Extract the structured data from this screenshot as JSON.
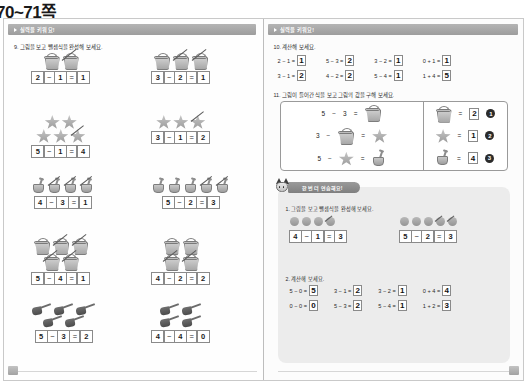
{
  "title": "70~71쪽",
  "left_page": {
    "band_label": "실력을 키워요!",
    "q9": {
      "label": "9. 그림을 보고 뺄셈식을 완성해 보세요.",
      "rows": [
        {
          "left": {
            "icon": "bucket",
            "total": 2,
            "crossed": 1,
            "layout": [
              2
            ],
            "eq": [
              "2",
              "−",
              "1",
              "=",
              "1"
            ]
          },
          "right": {
            "icon": "bucket",
            "total": 3,
            "crossed": 2,
            "layout": [
              3
            ],
            "eq": [
              "3",
              "−",
              "2",
              "=",
              "1"
            ]
          }
        },
        {
          "left": {
            "icon": "star",
            "total": 5,
            "crossed": 1,
            "layout": [
              2,
              3
            ],
            "eq": [
              "5",
              "−",
              "1",
              "=",
              "4"
            ]
          },
          "right": {
            "icon": "star",
            "total": 3,
            "crossed": 1,
            "layout": [
              3
            ],
            "eq": [
              "3",
              "−",
              "1",
              "=",
              "2"
            ]
          }
        },
        {
          "left": {
            "icon": "shovel",
            "total": 4,
            "crossed": 3,
            "layout": [
              4
            ],
            "eq": [
              "4",
              "−",
              "3",
              "=",
              "1"
            ]
          },
          "right": {
            "icon": "shovel",
            "total": 5,
            "crossed": 2,
            "layout": [
              5
            ],
            "eq": [
              "5",
              "−",
              "2",
              "=",
              "3"
            ]
          }
        },
        {
          "left": {
            "icon": "bucket",
            "total": 5,
            "crossed": 4,
            "layout": [
              3,
              2
            ],
            "eq": [
              "5",
              "−",
              "4",
              "=",
              "1"
            ]
          },
          "right": {
            "icon": "bucket",
            "total": 4,
            "crossed": 2,
            "layout": [
              2,
              2
            ],
            "eq": [
              "4",
              "−",
              "2",
              "=",
              "2"
            ]
          }
        },
        {
          "left": {
            "icon": "spade",
            "total": 5,
            "crossed": 0,
            "layout": [
              3,
              2
            ],
            "eq": [
              "5",
              "−",
              "3",
              "=",
              "2"
            ]
          },
          "right": {
            "icon": "spade",
            "total": 4,
            "crossed": 0,
            "layout": [
              2,
              2
            ],
            "eq": [
              "4",
              "−",
              "4",
              "=",
              "0"
            ]
          }
        }
      ]
    }
  },
  "right_page": {
    "band_label": "실력을 키워요!",
    "q10": {
      "label": "10. 계산해 보세요.",
      "columns": [
        [
          {
            "expr": "2 − 1 =",
            "answer": "1"
          },
          {
            "expr": "3 − 1 =",
            "answer": "2"
          }
        ],
        [
          {
            "expr": "5 − 3 =",
            "answer": "2"
          },
          {
            "expr": "4 − 2 =",
            "answer": "2"
          }
        ],
        [
          {
            "expr": "3 − 2 =",
            "answer": "1"
          },
          {
            "expr": "5 − 4 =",
            "answer": "1"
          }
        ],
        [
          {
            "expr": "0 + 1 =",
            "answer": "1"
          },
          {
            "expr": "1 + 4 =",
            "answer": "5"
          }
        ]
      ]
    },
    "q11": {
      "label": "11. 그림이 들어간 식을 보고 그림의 값을 구해 보세요.",
      "equations": [
        {
          "a": "5",
          "op": "−",
          "b_icon": "",
          "b_num": "3",
          "eq": "=",
          "result_icon": "bucket"
        },
        {
          "a": "3",
          "op": "−",
          "b_icon": "bucket",
          "b_num": "",
          "eq": "=",
          "result_icon": "star"
        },
        {
          "a": "5",
          "op": "−",
          "b_icon": "star",
          "b_num": "",
          "eq": "=",
          "result_icon": "shovel"
        }
      ],
      "answers": [
        {
          "icon": "bucket",
          "value": "2",
          "marker": "❶"
        },
        {
          "icon": "star",
          "value": "1",
          "marker": "❷"
        },
        {
          "icon": "shovel",
          "value": "4",
          "marker": "❸"
        }
      ]
    },
    "review": {
      "tab_label": "한 번 더 연습해요!",
      "item1": {
        "label": "1. 그림을 보고 뺄셈식을 완성해 보세요.",
        "left": {
          "dots": 4,
          "crossed": 1,
          "eq": [
            "4",
            "−",
            "1",
            "=",
            "3"
          ]
        },
        "right": {
          "dots": 5,
          "crossed": 2,
          "eq": [
            "5",
            "−",
            "2",
            "=",
            "3"
          ]
        }
      },
      "item2": {
        "label": "2. 계산해 보세요.",
        "columns": [
          [
            {
              "expr": "5 − 0 =",
              "answer": "5"
            },
            {
              "expr": "0 − 0 =",
              "answer": "0"
            }
          ],
          [
            {
              "expr": "3 − 1 =",
              "answer": "2"
            },
            {
              "expr": "5 − 3 =",
              "answer": "2"
            }
          ],
          [
            {
              "expr": "3 − 2 =",
              "answer": "1"
            },
            {
              "expr": "5 − 4 =",
              "answer": "1"
            }
          ],
          [
            {
              "expr": "0 + 4 =",
              "answer": "4"
            },
            {
              "expr": "1 + 2 =",
              "answer": "3"
            }
          ]
        ]
      }
    }
  },
  "colors": {
    "band": "#9d9d9d",
    "review_bg": "#ececec",
    "ink": "#1c1c1c"
  }
}
